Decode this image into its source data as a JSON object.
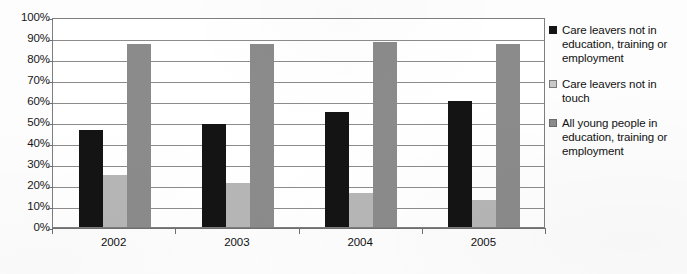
{
  "chart_data": {
    "type": "bar",
    "title": "",
    "subtitle": "",
    "xlabel": "",
    "ylabel": "",
    "categories": [
      "2002",
      "2003",
      "2004",
      "2005"
    ],
    "series": [
      {
        "name": "Care leavers not in education, training or employment",
        "color": "#141414",
        "values": [
          46,
          49,
          55,
          60
        ]
      },
      {
        "name": "Care leavers not in touch",
        "color": "#b6b6b6",
        "values": [
          25,
          21,
          16,
          13
        ]
      },
      {
        "name": "All young people in education, training or employment",
        "color": "#8b8b8b",
        "values": [
          87,
          87,
          88,
          87
        ]
      }
    ],
    "ylim": [
      0,
      100
    ],
    "ytick_values": [
      0,
      10,
      20,
      30,
      40,
      50,
      60,
      70,
      80,
      90,
      100
    ],
    "ytick_labels": [
      "0%",
      "10%",
      "20%",
      "30%",
      "40%",
      "50%",
      "60%",
      "70%",
      "80%",
      "90%",
      "100%"
    ],
    "grid": true,
    "grid_axis": "y",
    "legend_position": "right",
    "value_unit": "percent"
  },
  "legend": {
    "entries": [
      {
        "label": "Care leavers not in education, training or employment",
        "swatch": "black-square-icon"
      },
      {
        "label": "Care leavers not in touch",
        "swatch": "light-gray-square-icon"
      },
      {
        "label": "All young people in education, training or employment",
        "swatch": "medium-gray-square-icon"
      }
    ]
  },
  "colors": {
    "series_0": "#141414",
    "series_1": "#b6b6b6",
    "series_2": "#8b8b8b",
    "axis": "#6f6f6f",
    "gridline": "#8c8c8c",
    "plot_background": "#ffffff",
    "page_background": "#fdfdfd",
    "text": "#111111"
  }
}
